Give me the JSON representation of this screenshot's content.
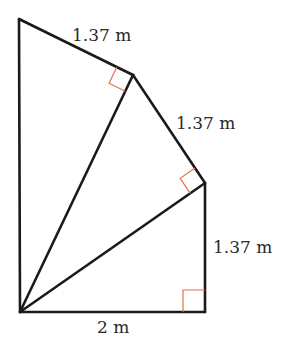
{
  "diagram": {
    "type": "geometry-spiral-of-right-triangles",
    "vertices": {
      "O": [
        20,
        312
      ],
      "A": [
        19,
        19
      ],
      "B": [
        133,
        75
      ],
      "C": [
        205,
        183
      ],
      "D": [
        205,
        312
      ]
    },
    "labels": {
      "top_edge": "1.37 m",
      "upper_right_edge": "1.37 m",
      "right_edge": "1.37 m",
      "bottom_edge": "2 m"
    },
    "colors": {
      "line": "#1a1a1a",
      "right_angle_marker": "#e0724f",
      "text": "#2a2a2a"
    },
    "right_angles": [
      "B",
      "C",
      "D"
    ]
  }
}
